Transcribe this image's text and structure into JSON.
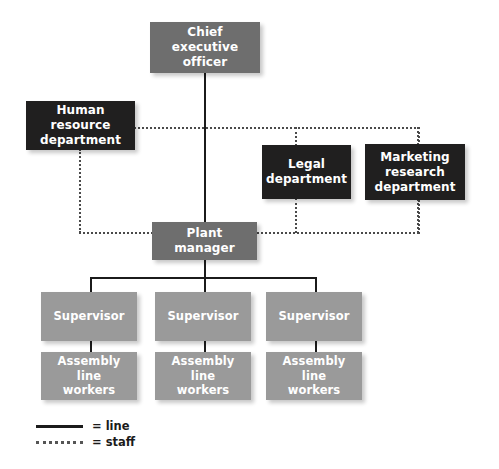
{
  "diagram": {
    "nodes": {
      "ceo": {
        "label": "Chief executive officer",
        "line1": "Chief executive",
        "line2": "officer"
      },
      "hr": {
        "label": "Human resource department",
        "line1": "Human resource",
        "line2": "department"
      },
      "legal": {
        "label": "Legal department",
        "line1": "Legal",
        "line2": "department"
      },
      "marketing": {
        "label": "Marketing research department",
        "line1": "Marketing",
        "line2": "research",
        "line3": "department"
      },
      "plant": {
        "label": "Plant manager"
      },
      "supervisor1": {
        "label": "Supervisor"
      },
      "supervisor2": {
        "label": "Supervisor"
      },
      "supervisor3": {
        "label": "Supervisor"
      },
      "workers1": {
        "label": "Assembly line workers",
        "line1": "Assembly line",
        "line2": "workers"
      },
      "workers2": {
        "label": "Assembly line workers",
        "line1": "Assembly line",
        "line2": "workers"
      },
      "workers3": {
        "label": "Assembly line workers",
        "line1": "Assembly line",
        "line2": "workers"
      }
    },
    "legend": {
      "line": {
        "symbol": "solid-line",
        "text": "= line"
      },
      "staff": {
        "symbol": "dotted-line",
        "text": "= staff"
      }
    },
    "colors": {
      "dark_box": "#201f1f",
      "mid_box": "#6e6e6e",
      "light_box": "#9a9a9a",
      "solid_connector": "#1b1b1b",
      "dotted_connector": "#4a4a4a",
      "box_text": "#ffffff",
      "background": "#ffffff"
    }
  }
}
